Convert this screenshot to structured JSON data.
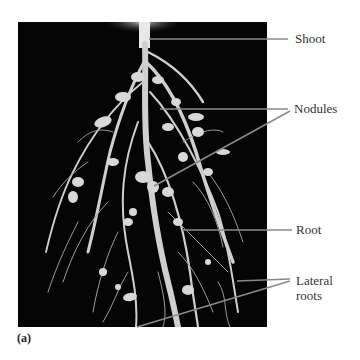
{
  "figure": {
    "panel_label": "(a)",
    "photo_description": "Root system with nodules on black background",
    "line_color": "#8a8a8a",
    "labels": [
      {
        "id": "shoot",
        "text": "Shoot"
      },
      {
        "id": "nodules",
        "text": "Nodules"
      },
      {
        "id": "root",
        "text": "Root"
      },
      {
        "id": "lateral_roots",
        "text": "Lateral\nroots",
        "line1": "Lateral",
        "line2": "roots"
      }
    ]
  }
}
